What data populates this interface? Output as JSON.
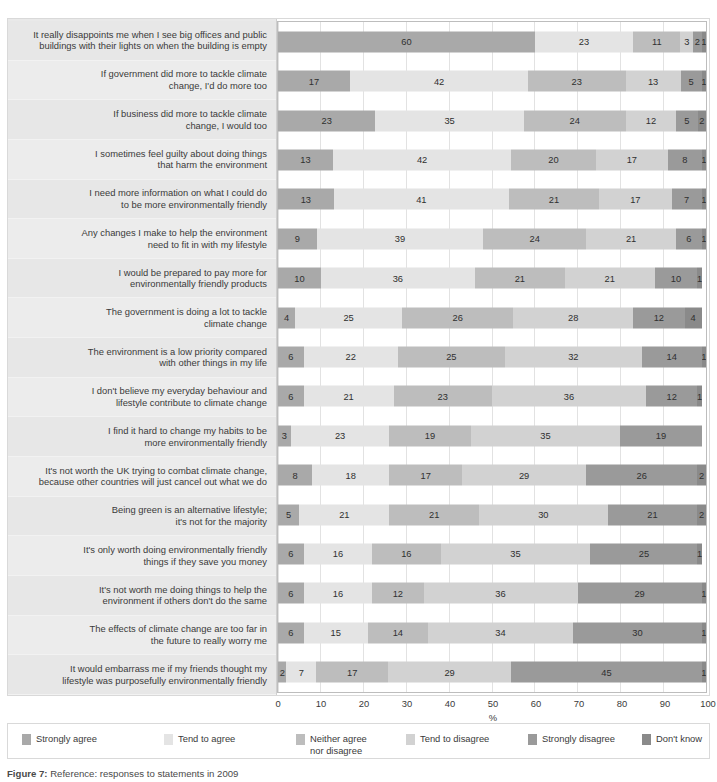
{
  "chart_data": {
    "type": "bar",
    "subtype": "stacked-horizontal-100pct",
    "title": "",
    "xlabel": "%",
    "ylabel": "",
    "xlim": [
      0,
      100
    ],
    "xticks": [
      "0",
      "10",
      "20",
      "30",
      "40",
      "50",
      "60",
      "70",
      "80",
      "90",
      "100"
    ],
    "grid": true,
    "legend_position": "bottom",
    "series": [
      {
        "name": "Strongly agree",
        "color": "#a9a9a9"
      },
      {
        "name": "Tend to agree",
        "color": "#e4e4e4"
      },
      {
        "name": "Neither agree nor disagree",
        "color": "#bdbdbd"
      },
      {
        "name": "Tend to disagree",
        "color": "#d2d2d2"
      },
      {
        "name": "Strongly disagree",
        "color": "#9a9a9a"
      },
      {
        "name": "Don't know",
        "color": "#8a8a8a"
      }
    ],
    "categories": [
      "It really disappoints me when I see big offices and public buildings with their lights on when the building is empty",
      "If government did more to tackle climate change, I'd do more too",
      "If business did more to tackle climate change, I would too",
      "I sometimes feel guilty about doing things that harm the environment",
      "I need more information on what I could do to be more environmentally friendly",
      "Any changes I make to help the environment need to fit in with my lifestyle",
      "I would be prepared to pay more for environmentally friendly products",
      "The government is doing a lot to tackle climate change",
      "The environment is a low priority compared with other things in my life",
      "I don't believe my everyday behaviour and lifestyle contribute to climate change",
      "I find it hard to change my habits to be more environmentally friendly",
      "It's not worth the UK trying to combat climate change, because other countries will just cancel out what we do",
      "Being green is an alternative lifestyle; it's not for the majority",
      "It's only worth doing environmentally friendly things if they save you money",
      "It's not worth me doing things to help the environment if others don't do the same",
      "The effects of climate change are too far in the future to really worry me",
      "It would embarrass me if my friends thought my lifestyle was purposefully environmentally friendly"
    ],
    "rows": [
      {
        "label_lines": [
          "It really disappoints me when I see big offices and public",
          "buildings with their lights on when the building is empty"
        ],
        "values": [
          60,
          23,
          11,
          3,
          2,
          1
        ]
      },
      {
        "label_lines": [
          "If government did more to tackle climate",
          "change, I'd do more too"
        ],
        "values": [
          17,
          42,
          23,
          13,
          5,
          1
        ]
      },
      {
        "label_lines": [
          "If business did more to tackle climate",
          "change, I would too"
        ],
        "values": [
          23,
          35,
          24,
          12,
          5,
          2
        ]
      },
      {
        "label_lines": [
          "I sometimes feel guilty about doing things",
          "that harm the environment"
        ],
        "values": [
          13,
          42,
          20,
          17,
          8,
          1
        ]
      },
      {
        "label_lines": [
          "I need more information on what I could do",
          "to be more environmentally friendly"
        ],
        "values": [
          13,
          41,
          21,
          17,
          7,
          1
        ]
      },
      {
        "label_lines": [
          "Any changes I make to help the environment",
          "need to fit in with my lifestyle"
        ],
        "values": [
          9,
          39,
          24,
          21,
          6,
          1
        ]
      },
      {
        "label_lines": [
          "I would be prepared to pay more for",
          "environmentally friendly products"
        ],
        "values": [
          10,
          36,
          21,
          21,
          10,
          1
        ]
      },
      {
        "label_lines": [
          "The government is doing a lot to tackle",
          "climate change"
        ],
        "values": [
          4,
          25,
          26,
          28,
          12,
          4
        ]
      },
      {
        "label_lines": [
          "The environment is a low priority compared",
          "with other things in my life"
        ],
        "values": [
          6,
          22,
          25,
          32,
          14,
          1
        ]
      },
      {
        "label_lines": [
          "I don't believe my everyday behaviour and",
          "lifestyle contribute to climate change"
        ],
        "values": [
          6,
          21,
          23,
          36,
          12,
          1
        ]
      },
      {
        "label_lines": [
          "I find it hard to change my habits to be",
          "more environmentally friendly"
        ],
        "values": [
          3,
          23,
          19,
          35,
          19,
          0
        ]
      },
      {
        "label_lines": [
          "It's not worth the UK trying to combat climate change,",
          "because other countries will just cancel out what we do"
        ],
        "values": [
          8,
          18,
          17,
          29,
          26,
          2
        ]
      },
      {
        "label_lines": [
          "Being green is an alternative lifestyle;",
          "it's not for the majority"
        ],
        "values": [
          5,
          21,
          21,
          30,
          21,
          2
        ]
      },
      {
        "label_lines": [
          "It's only worth doing environmentally friendly",
          "things if they save you money"
        ],
        "values": [
          6,
          16,
          16,
          35,
          25,
          1
        ]
      },
      {
        "label_lines": [
          "It's not worth me doing things to help the",
          "environment if others don't do the same"
        ],
        "values": [
          6,
          16,
          12,
          36,
          29,
          1
        ]
      },
      {
        "label_lines": [
          "The effects of climate change are too far in",
          "the future to really worry me"
        ],
        "values": [
          6,
          15,
          14,
          34,
          30,
          1
        ]
      },
      {
        "label_lines": [
          "It would embarrass me if my friends thought my",
          "lifestyle was purposefully environmentally friendly"
        ],
        "values": [
          2,
          7,
          17,
          29,
          45,
          1
        ]
      }
    ]
  },
  "axis": {
    "unit_label": "%",
    "ticks": [
      "0",
      "10",
      "20",
      "30",
      "40",
      "50",
      "60",
      "70",
      "80",
      "90",
      "100"
    ]
  },
  "legend": {
    "items": [
      {
        "label": "Strongly agree",
        "color": "#a9a9a9",
        "left": 14,
        "width": 140
      },
      {
        "label": "Tend to agree",
        "color": "#e4e4e4",
        "left": 156,
        "width": 130
      },
      {
        "label": "Neither agree",
        "label2": "nor disagree",
        "color": "#bdbdbd",
        "left": 288,
        "width": 108
      },
      {
        "label": "Tend to disagree",
        "color": "#d2d2d2",
        "left": 398,
        "width": 120
      },
      {
        "label": "Strongly disagree",
        "color": "#9a9a9a",
        "left": 520,
        "width": 122
      },
      {
        "label": "Don't know",
        "color": "#8a8a8a",
        "left": 634,
        "width": 80
      }
    ]
  },
  "caption": {
    "prefix": "Figure 7:",
    "text": "Reference: responses to statements in 2009"
  }
}
